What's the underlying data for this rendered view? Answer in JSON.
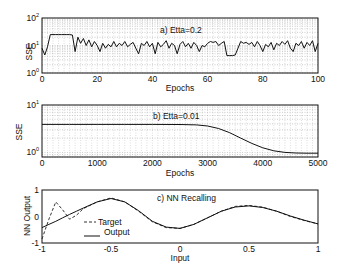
{
  "chart_data": [
    {
      "type": "line",
      "panel": "a",
      "title": "a)  Etta=0.2",
      "xlabel": "Epochs",
      "ylabel": "SSE",
      "yscale": "log",
      "xlim": [
        0,
        100
      ],
      "ylim": [
        1,
        100
      ],
      "xticks": [
        "0",
        "20",
        "40",
        "60",
        "80",
        "100"
      ],
      "yticks": [
        "10^0",
        "10^1",
        "10^2"
      ],
      "grid": true,
      "x": [
        0,
        1,
        2,
        3,
        4,
        5,
        6,
        7,
        8,
        9,
        10,
        11,
        12,
        13,
        14,
        15,
        16,
        17,
        18,
        19,
        20,
        21,
        22,
        23,
        24,
        25,
        26,
        27,
        28,
        29,
        30,
        31,
        32,
        33,
        34,
        35,
        36,
        37,
        38,
        39,
        40,
        41,
        42,
        43,
        44,
        45,
        46,
        47,
        48,
        49,
        50,
        51,
        52,
        53,
        54,
        55,
        56,
        57,
        58,
        59,
        60,
        61,
        62,
        63,
        64,
        65,
        66,
        67,
        68,
        69,
        70,
        71,
        72,
        73,
        74,
        75,
        76,
        77,
        78,
        79,
        80,
        81,
        82,
        83,
        84,
        85,
        86,
        87,
        88,
        89,
        90,
        91,
        92,
        93,
        94,
        95,
        96,
        97,
        98,
        99,
        100
      ],
      "values": [
        8,
        4.5,
        9,
        25,
        25,
        25,
        25,
        25,
        25,
        25,
        25,
        24,
        6,
        20,
        12,
        18,
        10,
        16,
        9,
        14,
        10,
        6,
        12,
        8,
        11,
        9,
        14,
        9,
        12,
        10,
        14,
        9,
        11,
        13,
        8,
        5,
        12,
        10,
        14,
        9,
        12,
        5,
        13,
        9,
        11,
        15,
        8,
        12,
        10,
        5,
        11,
        14,
        9,
        12,
        8,
        13,
        10,
        6,
        10,
        9,
        12,
        14,
        13,
        14,
        10,
        12,
        14,
        4.3,
        4.3,
        4.3,
        4.5,
        8,
        14,
        12,
        13,
        11,
        13,
        9,
        14,
        10,
        6,
        11,
        9,
        13,
        7,
        12,
        10,
        14,
        11,
        15,
        8,
        6,
        12,
        10,
        14,
        8,
        13,
        10,
        15,
        6,
        12
      ],
      "legend": []
    },
    {
      "type": "line",
      "panel": "b",
      "title": "b)  Etta=0.01",
      "xlabel": "Epochs",
      "ylabel": "SSE",
      "yscale": "log",
      "xlim": [
        0,
        5000
      ],
      "ylim": [
        0.8,
        10
      ],
      "xticks": [
        "0",
        "1000",
        "2000",
        "3000",
        "4000",
        "5000"
      ],
      "yticks": [
        "10^0",
        "10^1"
      ],
      "grid": true,
      "x": [
        0,
        500,
        1000,
        1500,
        2000,
        2500,
        2800,
        3000,
        3200,
        3400,
        3600,
        3800,
        4000,
        4200,
        4400,
        4600,
        4800,
        5000
      ],
      "values": [
        3.9,
        3.9,
        3.9,
        3.9,
        3.9,
        3.88,
        3.8,
        3.6,
        3.2,
        2.6,
        2.0,
        1.55,
        1.25,
        1.08,
        1.0,
        0.97,
        0.96,
        0.96
      ],
      "legend": []
    },
    {
      "type": "line",
      "panel": "c",
      "title": "c)  NN Recalling",
      "xlabel": "Input",
      "ylabel": "NN Output",
      "xlim": [
        -1,
        1
      ],
      "ylim": [
        -1,
        1
      ],
      "xticks": [
        "-1",
        "-0.5",
        "0",
        "0.5",
        "1"
      ],
      "yticks": [
        "-1",
        "0",
        "1"
      ],
      "grid": false,
      "legend": [
        "Target",
        "Output"
      ],
      "x": [
        -1,
        -0.95,
        -0.9,
        -0.85,
        -0.8,
        -0.75,
        -0.7,
        -0.6,
        -0.5,
        -0.4,
        -0.3,
        -0.2,
        -0.1,
        0,
        0.1,
        0.2,
        0.3,
        0.4,
        0.5,
        0.6,
        0.7,
        0.8,
        0.9,
        1
      ],
      "series": [
        {
          "name": "Target",
          "style": "dashed",
          "values": [
            -0.85,
            -0.1,
            0.55,
            0.25,
            -0.1,
            0.05,
            0.3,
            0.55,
            0.7,
            0.55,
            0.2,
            -0.2,
            -0.42,
            -0.45,
            -0.3,
            -0.05,
            0.2,
            0.38,
            0.42,
            0.35,
            0.2,
            0.0,
            -0.15,
            -0.28
          ]
        },
        {
          "name": "Output",
          "style": "solid",
          "values": [
            -0.42,
            -0.3,
            -0.18,
            -0.05,
            0.08,
            0.2,
            0.32,
            0.55,
            0.68,
            0.55,
            0.22,
            -0.18,
            -0.4,
            -0.45,
            -0.3,
            -0.05,
            0.2,
            0.36,
            0.4,
            0.34,
            0.2,
            0.02,
            -0.14,
            -0.28
          ]
        }
      ]
    }
  ],
  "labels": {
    "a_title": "a)  Etta=0.2",
    "b_title": "b)  Etta=0.01",
    "c_title": "c)  NN Recalling",
    "a_xlabel": "Epochs",
    "b_xlabel": "Epochs",
    "c_xlabel": "Input",
    "a_ylabel": "SSE",
    "b_ylabel": "SSE",
    "c_ylabel": "NN Output",
    "legend_target": "Target",
    "legend_output": "Output"
  }
}
